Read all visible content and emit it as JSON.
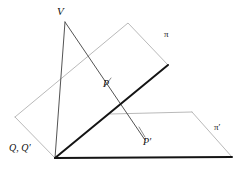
{
  "figure": {
    "background_color": "#ffffff",
    "width": 242,
    "height": 172,
    "colors": {
      "heavy_edge": "#141414",
      "light_edge": "#9b9b9b",
      "ray": "#4a4a4a",
      "connector": "#6e6e6e",
      "label_text": "#111111"
    },
    "labels": {
      "vertex": "V",
      "plane_upper": "π",
      "point_upper": "P",
      "points_on_axis": "Q, Q′",
      "point_lower": "P′",
      "plane_lower": "π′"
    },
    "geometry": {
      "plane_upper_polygon": "15,117 128,23 168,65 55,158",
      "plane_upper_light_edges": "15,117 128,23 168,65",
      "plane_upper_left_edge": "15,117 55,158",
      "intersection_axis": "168,65 55,158",
      "plane_lower_polygon": "110,114 192,112 232,157 55,158",
      "plane_lower_top_edge": "110,114 192,112",
      "plane_lower_right_edge": "192,112 232,157",
      "plane_lower_bottom_edge": "232,157 55,158",
      "ray_v_to_q": "65,22 55,158",
      "ray_v_through_p_to_pprime": "65,22 145,140",
      "connector_p_tick": "105,86 111,78",
      "connector_pprime_tick": "145,137 139,127"
    }
  }
}
